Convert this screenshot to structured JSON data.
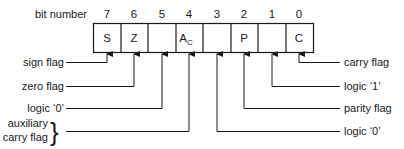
{
  "diagram": {
    "title_label": "bit number",
    "bits": [
      {
        "number": "7",
        "content": "S"
      },
      {
        "number": "6",
        "content": "Z"
      },
      {
        "number": "5",
        "content": ""
      },
      {
        "number": "4",
        "content": "A",
        "subscript": "C"
      },
      {
        "number": "3",
        "content": ""
      },
      {
        "number": "2",
        "content": "P"
      },
      {
        "number": "1",
        "content": ""
      },
      {
        "number": "0",
        "content": "C"
      }
    ],
    "left_labels": [
      {
        "bit": "7",
        "text": "sign flag"
      },
      {
        "bit": "6",
        "text": "zero flag"
      },
      {
        "bit": "5",
        "text": "logic ‘0’"
      },
      {
        "bit": "4",
        "text_line1": "auxiliary",
        "text_line2": "carry flag",
        "brace": "}"
      }
    ],
    "right_labels": [
      {
        "bit": "0",
        "text": "carry flag"
      },
      {
        "bit": "1",
        "text": "logic ‘1’"
      },
      {
        "bit": "2",
        "text": "parity flag"
      },
      {
        "bit": "3",
        "text": "logic ‘0’"
      }
    ],
    "colors": {
      "line": "#1a1a1a",
      "background": "#ffffff"
    }
  }
}
